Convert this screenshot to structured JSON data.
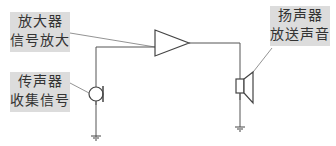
{
  "diagram": {
    "title": "",
    "labels": {
      "amplifier": {
        "line1": "放大器",
        "line2": "信号放大"
      },
      "speaker": {
        "line1": "扬声器",
        "line2": "放送声音"
      },
      "microphone": {
        "line1": "传声器",
        "line2": "收集信号"
      }
    },
    "components": [
      "microphone",
      "amplifier",
      "speaker",
      "ground",
      "ground"
    ],
    "colors": {
      "line": "#555555",
      "label_bg": "#dcdcdc",
      "text": "#333333"
    }
  }
}
